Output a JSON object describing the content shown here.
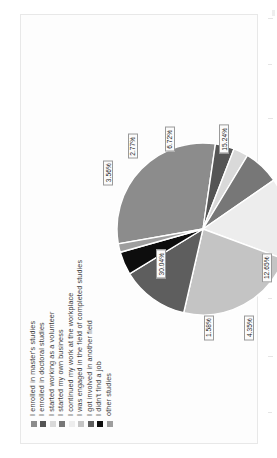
{
  "chart_data": {
    "type": "pie",
    "title": "",
    "xlabel": "",
    "ylabel": "",
    "legend_position": "top",
    "grid": false,
    "categories": [
      "I enrolled in master's studies",
      "I enrolled in doctoral studies",
      "I started working as a volunteer",
      "I started my own business",
      "I continued my work at the workplace",
      "I was engaged in the field of completed studies",
      "I got involved in another field",
      "I didn't find a job",
      "other studies"
    ],
    "values": [
      30.04,
      3.56,
      2.77,
      6.72,
      15.24,
      22.92,
      12.65,
      4.35,
      1.58
    ],
    "value_labels": [
      "30.04%",
      "3.56%",
      "2.77%",
      "6.72%",
      "15.24%",
      "22.92%",
      "12.65%",
      "4.35%",
      "1.58%"
    ],
    "colors": [
      "#8c8c8c",
      "#555555",
      "#d9d9d9",
      "#777777",
      "#ededed",
      "#c4c4c4",
      "#5e5e5e",
      "#0d0d0d",
      "#9e9e9e"
    ]
  },
  "legend": {
    "items": [
      {
        "label": "I enrolled in master's studies",
        "color": "#8c8c8c"
      },
      {
        "label": "I enrolled in doctoral studies",
        "color": "#555555"
      },
      {
        "label": "I started working as a volunteer",
        "color": "#d9d9d9"
      },
      {
        "label": "I started my own business",
        "color": "#777777"
      },
      {
        "label": "I continued my work at the workplace",
        "color": "#ededed"
      },
      {
        "label": "I was engaged in the field of completed studies",
        "color": "#c4c4c4"
      },
      {
        "label": "I got involved in another field",
        "color": "#5e5e5e"
      },
      {
        "label": "I didn't find a job",
        "color": "#0d0d0d"
      },
      {
        "label": "other studies",
        "color": "#9e9e9e"
      }
    ]
  },
  "slice_labels": [
    {
      "text": "30.04%",
      "x": 30,
      "y": 26
    },
    {
      "text": "3.56%",
      "x": 82,
      "y": -4
    },
    {
      "text": "2.77%",
      "x": 97,
      "y": 10
    },
    {
      "text": "6.72%",
      "x": 101,
      "y": 31
    },
    {
      "text": "15.24%",
      "x": 101,
      "y": 62
    },
    {
      "text": "22.92%",
      "x": 72,
      "y": 99
    },
    {
      "text": "12.65%",
      "x": 28,
      "y": 86
    },
    {
      "text": "4.35%",
      "x": -6,
      "y": 76
    },
    {
      "text": "1.58%",
      "x": -6,
      "y": 53
    }
  ]
}
